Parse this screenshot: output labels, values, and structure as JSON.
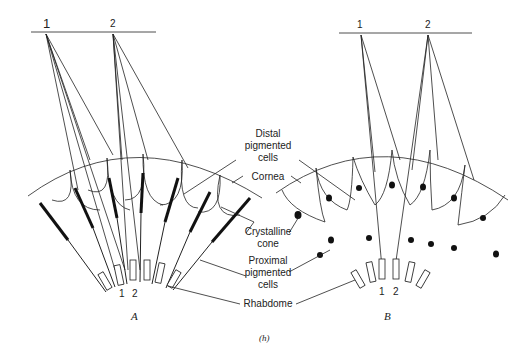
{
  "figure": {
    "caption": "(h)",
    "panels": [
      {
        "id": "A",
        "label": "A",
        "object_points": [
          "1",
          "2"
        ],
        "rhabdome_labels": [
          "1",
          "2"
        ]
      },
      {
        "id": "B",
        "label": "B",
        "object_points": [
          "1",
          "2"
        ],
        "rhabdome_labels": [
          "1",
          "2"
        ]
      }
    ],
    "labels": {
      "distal": "Distal\npigmented\ncells",
      "cornea": "Cornea",
      "crystalline": "Crystalline\ncone",
      "proximal": "Proximal\npigmented\ncells",
      "rhabdome": "Rhabdome"
    }
  }
}
